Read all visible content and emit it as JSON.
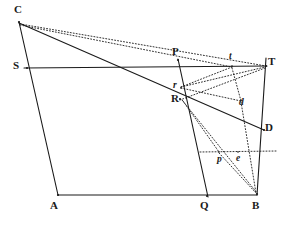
{
  "figure": {
    "width": 287,
    "height": 225,
    "background_color": "#ffffff",
    "ink_color": "#1a1a1a",
    "solid_stroke_width": 1.1,
    "dotted_stroke_width": 0.9,
    "dotted_dash_pattern": "1,2"
  },
  "points": [
    {
      "id": "C",
      "label": "C",
      "kind": "vertex",
      "x": 19,
      "y": 22,
      "label_x": 14,
      "label_y": 4
    },
    {
      "id": "S",
      "label": "S",
      "kind": "vertex",
      "x": 27,
      "y": 68,
      "label_x": 13,
      "label_y": 60
    },
    {
      "id": "A",
      "label": "A",
      "kind": "vertex",
      "x": 58,
      "y": 195,
      "label_x": 50,
      "label_y": 200
    },
    {
      "id": "Q",
      "label": "Q",
      "kind": "vertex",
      "x": 207,
      "y": 196,
      "label_x": 200,
      "label_y": 200
    },
    {
      "id": "B",
      "label": "B",
      "kind": "vertex",
      "x": 257,
      "y": 194,
      "label_x": 252,
      "label_y": 200
    },
    {
      "id": "T",
      "label": "T",
      "kind": "vertex",
      "x": 266,
      "y": 66,
      "label_x": 268,
      "label_y": 56
    },
    {
      "id": "D",
      "label": "D",
      "kind": "vertex",
      "x": 264,
      "y": 130,
      "label_x": 265,
      "label_y": 122
    },
    {
      "id": "P",
      "label": "P",
      "kind": "vertex",
      "x": 178,
      "y": 60,
      "label_x": 172,
      "label_y": 46
    },
    {
      "id": "R",
      "label": "R",
      "kind": "vertex",
      "x": 180,
      "y": 99,
      "label_x": 171,
      "label_y": 93
    },
    {
      "id": "r",
      "label": "r",
      "kind": "minor",
      "x": 181,
      "y": 88,
      "label_x": 173,
      "label_y": 81
    },
    {
      "id": "t",
      "label": "t",
      "kind": "minor",
      "x": 232,
      "y": 66,
      "label_x": 229,
      "label_y": 52
    },
    {
      "id": "d",
      "label": "d",
      "kind": "minor",
      "x": 241,
      "y": 100,
      "label_x": 239,
      "label_y": 98
    },
    {
      "id": "p",
      "label": "p",
      "kind": "minor",
      "x": 219,
      "y": 152,
      "label_x": 217,
      "label_y": 155
    },
    {
      "id": "e",
      "label": "e",
      "kind": "minor",
      "x": 238,
      "y": 152,
      "label_x": 236,
      "label_y": 154
    }
  ],
  "solid_lines": [
    {
      "name": "C-A",
      "x1": 19,
      "y1": 22,
      "x2": 58,
      "y2": 195
    },
    {
      "name": "A-B",
      "x1": 58,
      "y1": 195,
      "x2": 257,
      "y2": 195
    },
    {
      "name": "S-T",
      "x1": 24,
      "y1": 68,
      "x2": 267,
      "y2": 66
    },
    {
      "name": "C-D",
      "x1": 19,
      "y1": 23,
      "x2": 264,
      "y2": 130
    },
    {
      "name": "P-Q",
      "x1": 178,
      "y1": 59,
      "x2": 208,
      "y2": 197
    },
    {
      "name": "T-B",
      "x1": 266,
      "y1": 58,
      "x2": 257,
      "y2": 195
    }
  ],
  "dotted_lines": [
    {
      "name": "C-T",
      "x1": 20,
      "y1": 24,
      "x2": 266,
      "y2": 66
    },
    {
      "name": "C-t",
      "x1": 20,
      "y1": 25,
      "x2": 232,
      "y2": 67
    },
    {
      "name": "r-T",
      "x1": 181,
      "y1": 87,
      "x2": 265,
      "y2": 67
    },
    {
      "name": "r-t",
      "x1": 181,
      "y1": 87,
      "x2": 232,
      "y2": 67
    },
    {
      "name": "r-d",
      "x1": 181,
      "y1": 88,
      "x2": 241,
      "y2": 101
    },
    {
      "name": "t-d",
      "x1": 232,
      "y1": 68,
      "x2": 241,
      "y2": 101
    },
    {
      "name": "R-B",
      "x1": 182,
      "y1": 100,
      "x2": 257,
      "y2": 193
    },
    {
      "name": "d-B",
      "x1": 241,
      "y1": 102,
      "x2": 256,
      "y2": 193
    },
    {
      "name": "p-B",
      "x1": 219,
      "y1": 153,
      "x2": 256,
      "y2": 193
    },
    {
      "name": "R-p",
      "x1": 183,
      "y1": 101,
      "x2": 219,
      "y2": 152
    },
    {
      "name": "p-e-h",
      "x1": 200,
      "y1": 152,
      "x2": 277,
      "y2": 151
    },
    {
      "name": "T-R",
      "x1": 265,
      "y1": 68,
      "x2": 180,
      "y2": 100
    }
  ]
}
